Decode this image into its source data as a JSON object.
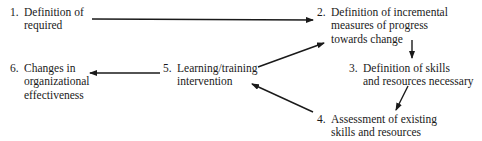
{
  "diagram": {
    "type": "flowchart",
    "nodes": [
      {
        "id": "1",
        "number": "1.",
        "lines": [
          "Definition of",
          "required"
        ]
      },
      {
        "id": "2",
        "number": "2.",
        "lines": [
          "Definition of incremental",
          "measures of progress",
          "towards change"
        ]
      },
      {
        "id": "3",
        "number": "3.",
        "lines": [
          "Definition of skills",
          "and resources necessary"
        ]
      },
      {
        "id": "4",
        "number": "4.",
        "lines": [
          "Assessment of existing",
          "skills and resources"
        ]
      },
      {
        "id": "5",
        "number": "5.",
        "lines": [
          "Learning/training",
          "intervention"
        ]
      },
      {
        "id": "6",
        "number": "6.",
        "lines": [
          "Changes in",
          "organizational",
          "effectiveness"
        ]
      }
    ],
    "edges": [
      {
        "from": "1",
        "to": "2"
      },
      {
        "from": "2",
        "to": "3"
      },
      {
        "from": "3",
        "to": "4"
      },
      {
        "from": "4",
        "to": "5"
      },
      {
        "from": "5",
        "to": "2"
      },
      {
        "from": "5",
        "to": "6"
      }
    ],
    "colors": {
      "ink": "#1a1a1a",
      "background": "#ffffff"
    }
  }
}
